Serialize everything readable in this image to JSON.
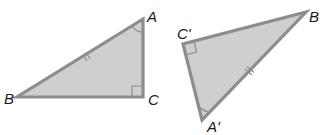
{
  "figure": {
    "colors": {
      "fill": "#cfcfcf",
      "stroke": "#8d8d8d",
      "label": "#1a1a1a",
      "background": "#ffffff"
    },
    "triangle_left": {
      "name": "ABC",
      "vertices": {
        "A": {
          "label": "A",
          "x": 143,
          "y": 19
        },
        "B": {
          "label": "B",
          "x": 17,
          "y": 97
        },
        "C": {
          "label": "C",
          "x": 143,
          "y": 97
        }
      },
      "right_angle_at": "C",
      "angle_arc_at": "A",
      "tick_marks": {
        "side": "AB",
        "count": 2
      }
    },
    "triangle_right": {
      "name": "A'B'C'",
      "vertices": {
        "A": {
          "label": "A'",
          "x": 202,
          "y": 120
        },
        "B": {
          "label": "B",
          "x": 306,
          "y": 12
        },
        "C": {
          "label": "C'",
          "x": 183,
          "y": 44
        }
      },
      "right_angle_at": "C'",
      "angle_arc_at": "A'",
      "tick_marks": {
        "side": "A'B",
        "count": 2
      }
    }
  }
}
